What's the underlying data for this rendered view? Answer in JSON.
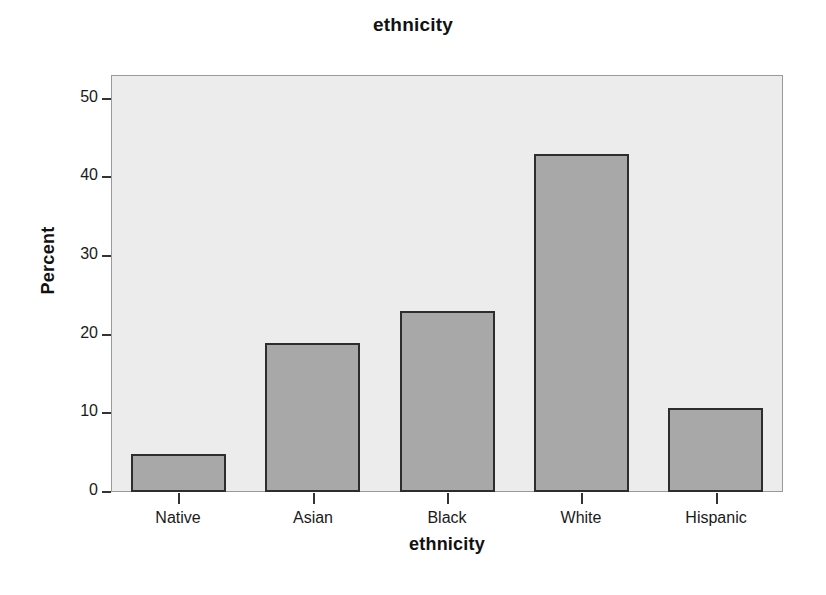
{
  "chart_data": {
    "type": "bar",
    "title": "ethnicity",
    "xlabel": "ethnicity",
    "ylabel": "Percent",
    "categories": [
      "Native",
      "Asian",
      "Black",
      "White",
      "Hispanic"
    ],
    "values": [
      4.8,
      19.0,
      23.0,
      43.0,
      10.7
    ],
    "ylim": [
      0,
      53
    ],
    "yticks": [
      0,
      10,
      20,
      30,
      40,
      50
    ],
    "ytick_labels": [
      "0",
      "10",
      "20",
      "30",
      "40",
      "50"
    ],
    "grid": false,
    "legend": null,
    "colors": {
      "bar_fill": "#a8a8a8",
      "bar_edge": "#2d2d2d",
      "plot_background": "#ececec",
      "figure_background": "#ffffff",
      "axis": "#333333",
      "text": "#111111"
    }
  },
  "axes": {
    "y_title": "Percent",
    "x_title": "ethnicity"
  },
  "header": {
    "title": "ethnicity"
  }
}
